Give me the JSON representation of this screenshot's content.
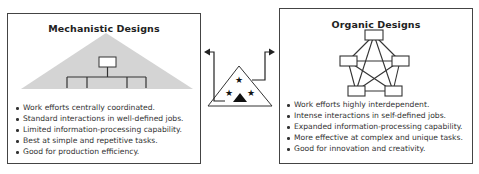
{
  "mechanistic": {
    "title": "Mechanistic Designs",
    "diagram_icon": "hierarchy-pyramid-icon",
    "bullets": [
      "Work efforts centrally coordinated.",
      "Standard interactions in well-defined jobs.",
      "Limited information-processing capability.",
      "Best at simple and repetitive tasks.",
      "Good for production efficiency."
    ]
  },
  "organic": {
    "title": "Organic Designs",
    "diagram_icon": "network-pentagon-icon",
    "bullets": [
      "Work efforts highly interdependent.",
      "Intense interactions in self-defined jobs.",
      "Expanded information-processing capability.",
      "More effective at complex and unique tasks.",
      "Good for innovation and creativity."
    ]
  },
  "center": {
    "icon": "organization-triangle-stars-icon",
    "arrows": [
      "arrow-left-icon",
      "arrow-right-icon"
    ]
  },
  "colors": {
    "border": "#444444",
    "pyramid_fill": "#d4d4d4",
    "ink": "#222222"
  }
}
